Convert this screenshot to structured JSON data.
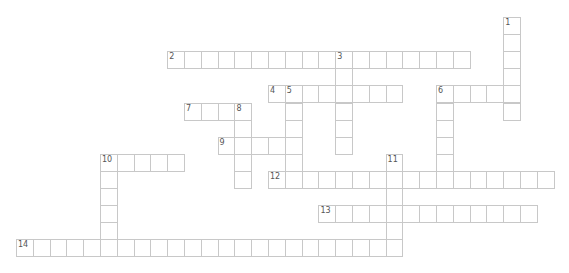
{
  "puzzle": {
    "type": "crossword",
    "grid": {
      "origin_x": 16,
      "origin_y": 17,
      "cell_w": 16.8,
      "cell_h": 17.1
    },
    "words": [
      {
        "number": "1",
        "direction": "down",
        "row": 0,
        "col": 29,
        "length": 6
      },
      {
        "number": "2",
        "direction": "across",
        "row": 2,
        "col": 9,
        "length": 18
      },
      {
        "number": "3",
        "direction": "down",
        "row": 2,
        "col": 19,
        "length": 6
      },
      {
        "number": "4",
        "direction": "across",
        "row": 4,
        "col": 15,
        "length": 8
      },
      {
        "number": "5",
        "direction": "down",
        "row": 4,
        "col": 16,
        "length": 6
      },
      {
        "number": "6",
        "direction": "across",
        "row": 4,
        "col": 25,
        "length": 5
      },
      {
        "number": "6",
        "direction": "down",
        "row": 4,
        "col": 25,
        "length": 6
      },
      {
        "number": "7",
        "direction": "across",
        "row": 5,
        "col": 10,
        "length": 4
      },
      {
        "number": "8",
        "direction": "down",
        "row": 5,
        "col": 13,
        "length": 5
      },
      {
        "number": "9",
        "direction": "across",
        "row": 7,
        "col": 12,
        "length": 5
      },
      {
        "number": "10",
        "direction": "across",
        "row": 8,
        "col": 5,
        "length": 5
      },
      {
        "number": "10",
        "direction": "down",
        "row": 8,
        "col": 5,
        "length": 6
      },
      {
        "number": "11",
        "direction": "down",
        "row": 8,
        "col": 22,
        "length": 6
      },
      {
        "number": "12",
        "direction": "across",
        "row": 9,
        "col": 15,
        "length": 17
      },
      {
        "number": "13",
        "direction": "across",
        "row": 11,
        "col": 18,
        "length": 13
      },
      {
        "number": "14",
        "direction": "across",
        "row": 13,
        "col": 0,
        "length": 23
      }
    ],
    "colors": {
      "border": "#c8c8c8",
      "number": "#555555",
      "background": "#ffffff"
    }
  }
}
